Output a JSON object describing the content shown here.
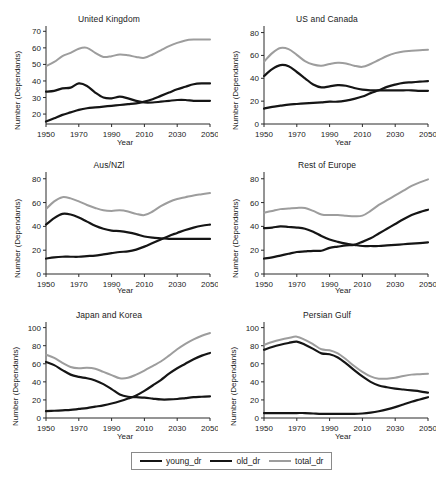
{
  "figure": {
    "xlabel": "Year",
    "ylabel": "Number (Dependants)",
    "xticks": [
      "1950",
      "1970",
      "1990",
      "2010",
      "2030",
      "2050"
    ],
    "series_styles": {
      "young_dr": {
        "color": "#151515",
        "width": 2.2
      },
      "old_dr": {
        "color": "#151515",
        "width": 2.2
      },
      "total_dr": {
        "color": "#9d9d9d",
        "width": 2.0
      }
    }
  },
  "legend": {
    "items": [
      {
        "label": "young_dr",
        "color": "#151515",
        "width": 2.2
      },
      {
        "label": "old_dr",
        "color": "#151515",
        "width": 2.2
      },
      {
        "label": "total_dr",
        "color": "#9d9d9d",
        "width": 2.0
      }
    ]
  },
  "chart_data": [
    {
      "type": "line",
      "title": "United Kingdom",
      "xlabel": "Year",
      "ylabel": "Number (Dependants)",
      "xlim": [
        1950,
        2050
      ],
      "ylim": [
        14,
        72
      ],
      "yticks": [
        20,
        30,
        40,
        50,
        60,
        70
      ],
      "xticks": [
        1950,
        1970,
        1990,
        2010,
        2030,
        2050
      ],
      "grid": false,
      "x": [
        1950,
        1955,
        1960,
        1965,
        1970,
        1975,
        1980,
        1985,
        1990,
        1995,
        2000,
        2005,
        2010,
        2015,
        2020,
        2025,
        2030,
        2035,
        2040,
        2045,
        2050
      ],
      "series": [
        {
          "name": "young_dr",
          "values": [
            33.5,
            34.0,
            35.5,
            36.0,
            38.5,
            37.0,
            33.0,
            30.0,
            29.5,
            30.5,
            29.5,
            28.0,
            27.0,
            27.0,
            27.5,
            28.0,
            28.5,
            28.5,
            28.0,
            28.0,
            28.0
          ]
        },
        {
          "name": "old_dr",
          "values": [
            15.5,
            17.5,
            19.5,
            21.0,
            22.5,
            23.5,
            24.0,
            24.5,
            25.0,
            25.5,
            26.0,
            26.5,
            27.5,
            29.0,
            31.0,
            33.0,
            35.0,
            36.5,
            38.0,
            38.5,
            38.5
          ]
        },
        {
          "name": "total_dr",
          "values": [
            49.0,
            51.5,
            55.0,
            57.0,
            59.5,
            60.0,
            57.0,
            54.5,
            55.0,
            56.0,
            55.5,
            54.5,
            54.0,
            56.0,
            58.5,
            61.0,
            63.0,
            64.5,
            65.0,
            65.0,
            65.0
          ]
        }
      ]
    },
    {
      "type": "line",
      "title": "US and Canada",
      "xlabel": "Year",
      "ylabel": "Number (Dependants)",
      "xlim": [
        1950,
        2050
      ],
      "ylim": [
        0,
        84
      ],
      "yticks": [
        0,
        20,
        40,
        60,
        80
      ],
      "xticks": [
        1950,
        1970,
        1990,
        2010,
        2030,
        2050
      ],
      "grid": false,
      "x": [
        1950,
        1955,
        1960,
        1965,
        1970,
        1975,
        1980,
        1985,
        1990,
        1995,
        2000,
        2005,
        2010,
        2015,
        2020,
        2025,
        2030,
        2035,
        2040,
        2045,
        2050
      ],
      "series": [
        {
          "name": "young_dr",
          "values": [
            42.0,
            48.0,
            51.5,
            50.5,
            45.5,
            40.0,
            34.5,
            32.0,
            33.0,
            34.0,
            33.5,
            31.5,
            30.0,
            29.5,
            29.5,
            29.5,
            29.5,
            29.5,
            29.5,
            29.0,
            29.0
          ]
        },
        {
          "name": "old_dr",
          "values": [
            13.5,
            15.0,
            16.0,
            17.0,
            17.5,
            18.0,
            18.5,
            19.0,
            19.5,
            19.5,
            20.5,
            22.0,
            24.0,
            27.0,
            29.5,
            32.5,
            34.5,
            36.0,
            36.5,
            37.0,
            37.5
          ]
        },
        {
          "name": "total_dr",
          "values": [
            54.5,
            62.0,
            66.5,
            65.5,
            60.5,
            55.0,
            52.0,
            51.0,
            52.5,
            53.5,
            53.0,
            51.0,
            50.0,
            52.5,
            56.0,
            59.5,
            62.0,
            63.5,
            64.0,
            64.5,
            65.0
          ]
        }
      ]
    },
    {
      "type": "line",
      "title": "Aus/NZl",
      "xlabel": "Year",
      "ylabel": "Number (Dependants)",
      "xlim": [
        1950,
        2050
      ],
      "ylim": [
        0,
        84
      ],
      "yticks": [
        0,
        20,
        40,
        60,
        80
      ],
      "xticks": [
        1950,
        1970,
        1990,
        2010,
        2030,
        2050
      ],
      "grid": false,
      "x": [
        1950,
        1955,
        1960,
        1965,
        1970,
        1975,
        1980,
        1985,
        1990,
        1995,
        2000,
        2005,
        2010,
        2015,
        2020,
        2025,
        2030,
        2035,
        2040,
        2045,
        2050
      ],
      "series": [
        {
          "name": "young_dr",
          "values": [
            41.5,
            47.0,
            50.5,
            50.0,
            47.5,
            44.0,
            40.5,
            38.0,
            36.5,
            36.0,
            35.0,
            33.5,
            31.5,
            30.5,
            30.0,
            29.5,
            29.5,
            29.5,
            29.5,
            29.5,
            29.5
          ]
        },
        {
          "name": "old_dr",
          "values": [
            13.0,
            14.0,
            14.5,
            14.5,
            14.5,
            15.0,
            15.5,
            16.5,
            17.5,
            18.5,
            19.0,
            20.5,
            23.0,
            26.0,
            29.0,
            32.0,
            34.5,
            37.0,
            39.0,
            40.5,
            41.5
          ]
        },
        {
          "name": "total_dr",
          "values": [
            54.5,
            61.0,
            64.5,
            63.5,
            61.0,
            58.0,
            55.5,
            53.5,
            53.0,
            53.5,
            52.5,
            50.5,
            49.5,
            52.5,
            57.0,
            60.5,
            63.0,
            64.5,
            66.0,
            67.0,
            68.0
          ]
        }
      ]
    },
    {
      "type": "line",
      "title": "Rest of Europe",
      "xlabel": "Year",
      "ylabel": "Number (Dependants)",
      "xlim": [
        1950,
        2050
      ],
      "ylim": [
        0,
        84
      ],
      "yticks": [
        0,
        20,
        40,
        60,
        80
      ],
      "xticks": [
        1950,
        1970,
        1990,
        2010,
        2030,
        2050
      ],
      "grid": false,
      "x": [
        1950,
        1955,
        1960,
        1965,
        1970,
        1975,
        1980,
        1985,
        1990,
        1995,
        2000,
        2005,
        2010,
        2015,
        2020,
        2025,
        2030,
        2035,
        2040,
        2045,
        2050
      ],
      "series": [
        {
          "name": "young_dr",
          "values": [
            38.5,
            39.0,
            40.0,
            39.5,
            39.0,
            38.0,
            35.5,
            32.0,
            29.0,
            27.0,
            25.5,
            24.5,
            23.5,
            23.5,
            23.5,
            24.0,
            24.5,
            25.0,
            25.5,
            26.0,
            26.5
          ]
        },
        {
          "name": "old_dr",
          "values": [
            13.0,
            14.0,
            15.5,
            17.0,
            18.5,
            19.0,
            19.5,
            19.5,
            22.0,
            23.0,
            24.0,
            24.5,
            27.0,
            30.0,
            34.0,
            38.0,
            42.0,
            46.0,
            49.5,
            52.0,
            54.0
          ]
        },
        {
          "name": "total_dr",
          "values": [
            51.5,
            53.0,
            54.5,
            55.0,
            55.5,
            55.5,
            53.0,
            50.0,
            49.5,
            49.5,
            49.0,
            48.5,
            49.0,
            53.0,
            58.0,
            62.0,
            66.0,
            70.0,
            74.0,
            77.0,
            79.5
          ]
        }
      ]
    },
    {
      "type": "line",
      "title": "Japan and Korea",
      "xlabel": "Year",
      "ylabel": "Number (Dependants)",
      "xlim": [
        1950,
        2050
      ],
      "ylim": [
        0,
        104
      ],
      "yticks": [
        0,
        20,
        40,
        60,
        80,
        100
      ],
      "xticks": [
        1950,
        1970,
        1990,
        2010,
        2030,
        2050
      ],
      "grid": false,
      "x": [
        1950,
        1955,
        1960,
        1965,
        1970,
        1975,
        1980,
        1985,
        1990,
        1995,
        2000,
        2005,
        2010,
        2015,
        2020,
        2025,
        2030,
        2035,
        2040,
        2045,
        2050
      ],
      "series": [
        {
          "name": "young_dr",
          "values": [
            62.0,
            58.5,
            53.0,
            48.0,
            45.5,
            44.0,
            41.5,
            37.5,
            32.0,
            26.0,
            23.5,
            23.0,
            22.5,
            21.5,
            20.5,
            20.5,
            21.0,
            22.0,
            23.0,
            23.5,
            24.0
          ]
        },
        {
          "name": "old_dr",
          "values": [
            7.5,
            8.0,
            8.5,
            9.0,
            10.0,
            11.0,
            12.5,
            14.0,
            16.0,
            18.5,
            21.5,
            25.0,
            30.0,
            36.0,
            42.0,
            49.0,
            55.0,
            60.0,
            65.0,
            69.0,
            72.0
          ]
        },
        {
          "name": "total_dr",
          "values": [
            70.0,
            66.5,
            61.0,
            56.5,
            55.0,
            55.5,
            54.5,
            51.0,
            47.5,
            44.0,
            44.5,
            48.0,
            52.5,
            57.5,
            62.5,
            69.0,
            76.0,
            82.0,
            87.0,
            91.0,
            94.0
          ]
        }
      ]
    },
    {
      "type": "line",
      "title": "Persian Gulf",
      "xlabel": "Year",
      "ylabel": "Number (Dependants)",
      "xlim": [
        1950,
        2050
      ],
      "ylim": [
        0,
        104
      ],
      "yticks": [
        0,
        20,
        40,
        60,
        80,
        100
      ],
      "xticks": [
        1950,
        1970,
        1990,
        2010,
        2030,
        2050
      ],
      "grid": false,
      "x": [
        1950,
        1955,
        1960,
        1965,
        1970,
        1975,
        1980,
        1985,
        1990,
        1995,
        2000,
        2005,
        2010,
        2015,
        2020,
        2025,
        2030,
        2035,
        2040,
        2045,
        2050
      ],
      "series": [
        {
          "name": "young_dr",
          "values": [
            75.5,
            78.5,
            81.0,
            83.0,
            84.5,
            81.0,
            76.5,
            71.5,
            70.5,
            67.0,
            60.5,
            53.0,
            46.0,
            40.0,
            36.0,
            34.0,
            32.5,
            31.5,
            30.5,
            29.5,
            28.0
          ]
        },
        {
          "name": "old_dr",
          "values": [
            5.5,
            5.5,
            5.5,
            5.5,
            5.5,
            5.5,
            5.0,
            4.5,
            4.5,
            4.5,
            4.5,
            4.5,
            5.0,
            6.0,
            7.5,
            9.5,
            12.0,
            15.0,
            18.0,
            20.5,
            23.0
          ]
        },
        {
          "name": "total_dr",
          "values": [
            81.0,
            84.0,
            86.5,
            88.5,
            90.0,
            86.5,
            81.5,
            76.0,
            75.0,
            71.5,
            65.0,
            57.5,
            51.0,
            46.0,
            43.5,
            43.5,
            44.5,
            46.5,
            48.0,
            48.5,
            49.0
          ]
        }
      ]
    }
  ]
}
